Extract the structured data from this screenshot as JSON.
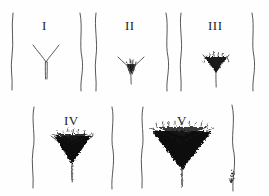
{
  "figure": {
    "background_color": "#fefefe",
    "ink_color": "#2b2b2b",
    "hair_color": "#1a1a1a",
    "width": 269,
    "height": 196,
    "rows": 2,
    "artifact_mark": "ink-smudge"
  },
  "stages": [
    {
      "id": "stage-1",
      "label": "I",
      "row": 1,
      "label_x": 46,
      "label_y": 26,
      "center_x": 46,
      "hair_density": "none",
      "hair_width": 0,
      "hair_height": 0,
      "description": "No pubic hair; vellus only"
    },
    {
      "id": "stage-2",
      "label": "II",
      "row": 1,
      "label_x": 131,
      "label_y": 26,
      "center_x": 131,
      "hair_density": "sparse",
      "hair_width": 9,
      "hair_height": 13,
      "description": "Sparse, lightly pigmented hair along labia / base of midline"
    },
    {
      "id": "stage-3",
      "label": "III",
      "row": 1,
      "label_x": 216,
      "label_y": 26,
      "center_x": 216,
      "hair_density": "moderate",
      "hair_width": 22,
      "hair_height": 15,
      "description": "Darker, coarser, curlier hair spreading over the junction of the pubes"
    },
    {
      "id": "stage-4",
      "label": "IV",
      "row": 2,
      "label_x": 72,
      "label_y": 122,
      "center_x": 72,
      "hair_density": "dense",
      "hair_width": 38,
      "hair_height": 30,
      "description": "Adult-type hair, smaller area than adult; no spread to medial thighs"
    },
    {
      "id": "stage-5",
      "label": "V",
      "row": 2,
      "label_x": 182,
      "label_y": 122,
      "center_x": 182,
      "hair_density": "adult",
      "hair_width": 60,
      "hair_height": 38,
      "description": "Adult in quantity and type, horizontal upper border, inverse triangle"
    }
  ]
}
